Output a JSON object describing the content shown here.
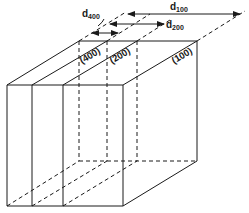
{
  "diagram": {
    "planes": [
      {
        "label": "(400)"
      },
      {
        "label": "(200)"
      },
      {
        "label": "(100)"
      }
    ],
    "spacings": [
      {
        "label": "d",
        "sub": "400"
      },
      {
        "label": "d",
        "sub": "200"
      },
      {
        "label": "d",
        "sub": "100"
      }
    ],
    "colors": {
      "line": "#1a1a1a",
      "background": "#ffffff"
    }
  }
}
